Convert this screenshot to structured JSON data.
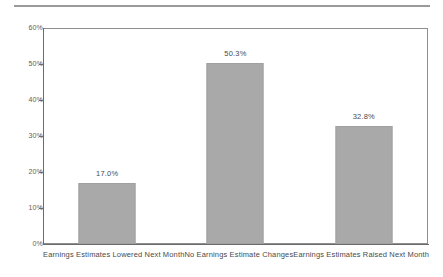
{
  "chart_data": {
    "type": "bar",
    "title": "",
    "subtitle": "",
    "xlabel": "",
    "ylabel": "",
    "categories": [
      "Earnings Estimates Lowered Next Month",
      "No Earnings Estimate Changes",
      "Earnings Estimates Raised Next Month"
    ],
    "values": [
      17.0,
      50.3,
      32.8
    ],
    "data_labels": [
      "17.0%",
      "50.3%",
      "32.8%"
    ],
    "ylim": [
      0,
      60
    ],
    "yticks": [
      0,
      10,
      20,
      30,
      40,
      50,
      60
    ],
    "ytick_labels": [
      "0%",
      "10%",
      "20%",
      "30%",
      "40%",
      "50%",
      "60%"
    ],
    "grid": false,
    "legend": null,
    "bar_color": "#a9a9a9",
    "axis_color": "#6b6b6b",
    "text_color": "#4a4a4a"
  }
}
